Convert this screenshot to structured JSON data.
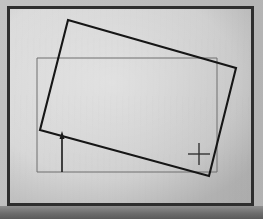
{
  "scene": {
    "title": "Rotated rectangle overlay on axis-aligned rectangle",
    "kind": "technical-line-drawing-photo",
    "width": 263,
    "height": 219,
    "background_color": "#b9b9b9",
    "panel_color": "#d6d6d6",
    "frame_color": "#2e2e2e",
    "ink_color": "#1a1a1a",
    "thin_line_color": "#6b6b6b"
  },
  "frame": {
    "name": "photo-frame",
    "x": 7,
    "y": 6,
    "width": 247,
    "height": 201,
    "border_width": 3,
    "border_color": "#2e2e2e"
  },
  "panel": {
    "name": "drawing-panel",
    "x": 10,
    "y": 9,
    "width": 241,
    "height": 194
  },
  "shapes": {
    "reference_rectangle": {
      "label": "axis-aligned reference rectangle",
      "stroke": "#6e6e6e",
      "stroke_width": 1,
      "fill": "none",
      "x": 37,
      "y": 58,
      "width": 180,
      "height": 114,
      "corners": [
        [
          37,
          58
        ],
        [
          217,
          58
        ],
        [
          217,
          172
        ],
        [
          37,
          172
        ]
      ]
    },
    "rotated_rectangle": {
      "label": "rotated rectangle",
      "stroke": "#161616",
      "stroke_width": 2.1,
      "fill": "none",
      "rotation_degrees": -16.0,
      "corners": [
        [
          68,
          20
        ],
        [
          236,
          68
        ],
        [
          209,
          176
        ],
        [
          40,
          130
        ]
      ]
    }
  },
  "annotations": {
    "arrow": {
      "label": "offset arrow",
      "name": "up-arrow-annotation",
      "stroke": "#1a1a1a",
      "stroke_width": 1.6,
      "x": 62,
      "y_tail": 172,
      "y_head": 132,
      "head_width": 5,
      "head_length": 7,
      "direction": "up"
    },
    "crosshair": {
      "label": "crosshair registration mark",
      "name": "crosshair-marker",
      "stroke": "#333333",
      "stroke_width": 1.4,
      "center_x": 199,
      "center_y": 154,
      "arm_length": 11
    }
  }
}
